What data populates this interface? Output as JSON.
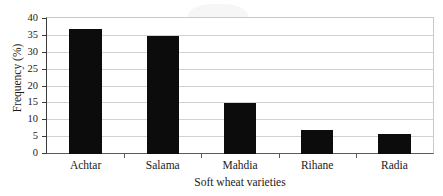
{
  "chart_data": {
    "type": "bar",
    "title": "",
    "categories": [
      "Achtar",
      "Salama",
      "Mahdia",
      "Rihane",
      "Radia"
    ],
    "values": [
      37,
      35,
      15,
      7,
      6
    ],
    "xlabel": "Soft wheat varieties",
    "ylabel": "Frequency (%)",
    "ylim": [
      0,
      40
    ],
    "ytick_labels": [
      "0",
      "5",
      "10",
      "15",
      "20",
      "25",
      "30",
      "35",
      "40"
    ],
    "ytick_values": [
      0,
      5,
      10,
      15,
      20,
      25,
      30,
      35,
      40
    ],
    "grid": "horizontal",
    "legend": "none",
    "bar_color": "#0c0c0c",
    "grid_color": "#d2d2d2",
    "axis_color": "#3a3a3a"
  }
}
